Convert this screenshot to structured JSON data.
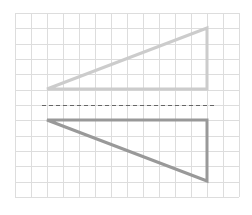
{
  "diagram": {
    "grid": {
      "x0": 15,
      "y0": 13,
      "x1": 239,
      "y1": 197,
      "cols": 14,
      "rows": 12,
      "color": "#dddddd"
    },
    "shapes": [
      {
        "name": "original-triangle",
        "points": [
          [
            47,
            89
          ],
          [
            207,
            89
          ],
          [
            207,
            28
          ]
        ],
        "stroke": "#cccccc",
        "stroke_width": 3
      },
      {
        "name": "reflected-triangle",
        "points": [
          [
            47,
            120
          ],
          [
            207,
            120
          ],
          [
            207,
            181
          ]
        ],
        "stroke": "#999999",
        "stroke_width": 3
      }
    ],
    "mirror_line": {
      "x1": 42,
      "y1": 105,
      "x2": 216,
      "y2": 105,
      "stroke": "#666666",
      "dash": "4,3"
    }
  }
}
